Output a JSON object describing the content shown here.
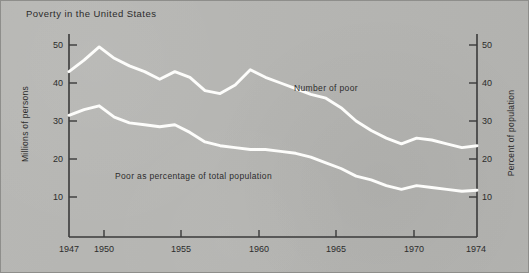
{
  "figure": {
    "background_color": "#b6b6b3",
    "line_color": "#fdfdfb",
    "axis_color": "#3a3a3a",
    "text_color": "#2c2c2c",
    "border_color": "#8e8e8b"
  },
  "chart_data": {
    "type": "line",
    "title": "Poverty in the United States",
    "xlabel": "",
    "ylabel": "Millions of persons",
    "y2label": "Percent of population",
    "xlim": [
      1947,
      1974
    ],
    "ylim": [
      0,
      54
    ],
    "y2lim": [
      0,
      54
    ],
    "grid": false,
    "legend": "inline-annotations",
    "xticks": [
      1947,
      1950,
      1955,
      1960,
      1965,
      1970,
      1974
    ],
    "xticklabels": [
      "1947",
      "1950",
      "1955",
      "1960",
      "1965",
      "1970",
      "1974"
    ],
    "yticks": [
      10,
      20,
      30,
      40,
      50
    ],
    "yticklabels": [
      "10",
      "20",
      "30",
      "40",
      "50"
    ],
    "y2ticks": [
      10,
      20,
      30,
      40,
      50
    ],
    "y2ticklabels": [
      "10",
      "20",
      "30",
      "40",
      "50"
    ],
    "x": [
      1947,
      1948,
      1949,
      1950,
      1951,
      1952,
      1953,
      1954,
      1955,
      1956,
      1957,
      1958,
      1959,
      1960,
      1961,
      1962,
      1963,
      1964,
      1965,
      1966,
      1967,
      1968,
      1969,
      1970,
      1971,
      1972,
      1973,
      1974
    ],
    "series": [
      {
        "name": "Number of poor",
        "axis": "left",
        "units": "millions of persons",
        "values": [
          43.0,
          46.0,
          49.5,
          46.5,
          44.5,
          43.0,
          41.0,
          43.0,
          41.5,
          38.0,
          37.2,
          39.5,
          43.5,
          41.5,
          40.0,
          38.5,
          37.0,
          36.0,
          33.5,
          30.0,
          27.5,
          25.5,
          24.0,
          25.5,
          25.0,
          24.0,
          23.0,
          23.5
        ],
        "endpoint_note": "23.5 million in 1974"
      },
      {
        "name": "Poor as percentage of total population",
        "axis": "right",
        "units": "percent of population",
        "values": [
          31.5,
          33.0,
          34.0,
          31.0,
          29.5,
          29.0,
          28.5,
          29.0,
          27.0,
          24.5,
          23.5,
          23.0,
          22.5,
          22.5,
          22.0,
          21.5,
          20.5,
          19.0,
          17.5,
          15.5,
          14.5,
          13.0,
          12.0,
          13.0,
          12.5,
          12.0,
          11.5,
          11.8
        ],
        "endpoint_note": "11.8 percent in 1974"
      }
    ],
    "annotations": [
      {
        "text": "Number of poor",
        "for_series": "Number of poor"
      },
      {
        "text": "Poor as percentage of total population",
        "for_series": "Poor as percentage of total population"
      }
    ]
  }
}
